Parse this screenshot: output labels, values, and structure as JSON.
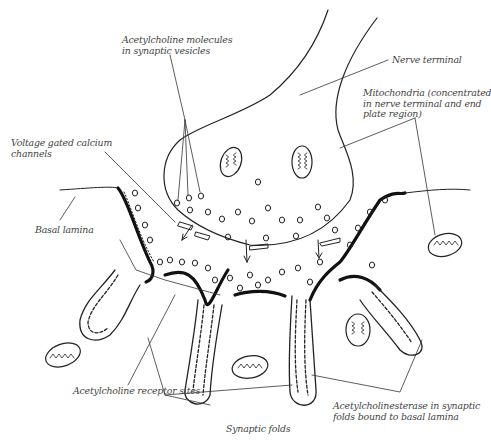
{
  "diagram": {
    "labels": {
      "ach_vesicles": "Acetylcholine molecules\nin synaptic vesicles",
      "nerve_terminal": "Nerve terminal",
      "mitochondria": "Mitochondria (concentrated\nin nerve terminal and end\nplate region)",
      "calcium_channels": "Voltage gated calcium\nchannels",
      "basal_lamina": "Basal lamina",
      "ach_receptor_sites": "Acetylcholine receptor sites",
      "synaptic_folds": "Synaptic folds",
      "acetylcholinesterase": "Acetylcholinesterase in synaptic\nfolds bound to basal lamina"
    },
    "colors": {
      "line": "#222222",
      "label": "#444444",
      "background": "#ffffff"
    }
  }
}
